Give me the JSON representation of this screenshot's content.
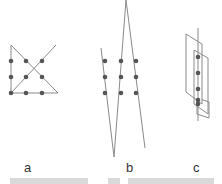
{
  "diagram": {
    "panels": [
      {
        "label": "a",
        "dots": 9
      },
      {
        "label": "b",
        "dots": 9
      },
      {
        "label": "c",
        "dots": 9
      }
    ],
    "colors": {
      "line": "#8a8a8a",
      "dot": "#555555",
      "text": "#333333"
    }
  }
}
